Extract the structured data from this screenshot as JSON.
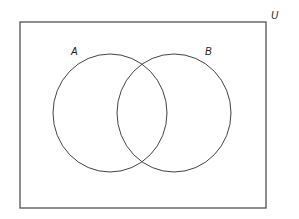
{
  "diagram": {
    "type": "venn",
    "line_color": "#444444",
    "background": "#ffffff",
    "universe": {
      "label": "U",
      "rect": {
        "x": 20,
        "y": 22,
        "width": 246,
        "height": 186
      },
      "label_pos": {
        "x": 271,
        "y": 11
      }
    },
    "sets": [
      {
        "id": "A",
        "label": "A",
        "center": {
          "x": 110,
          "y": 113
        },
        "rx": 57,
        "ry": 59,
        "label_pos": {
          "x": 71,
          "y": 47
        }
      },
      {
        "id": "B",
        "label": "B",
        "center": {
          "x": 174,
          "y": 113
        },
        "rx": 57,
        "ry": 59,
        "label_pos": {
          "x": 205,
          "y": 47
        }
      }
    ]
  }
}
